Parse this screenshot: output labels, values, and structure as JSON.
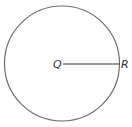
{
  "diagram": {
    "shape": "circle",
    "center_label": "Q",
    "point_label": "R",
    "segment": "QR (radius)",
    "stroke_color": "#6b6b6b",
    "line_color": "#333333"
  }
}
